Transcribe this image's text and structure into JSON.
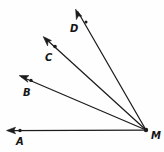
{
  "figure": {
    "type": "geometry-ray-diagram",
    "background_color": "#fefefe",
    "stroke_color": "#1c1c1c",
    "vertex": {
      "label": "M",
      "x": 146,
      "y": 130,
      "label_x": 151,
      "label_y": 139
    },
    "rays": [
      {
        "name": "ray-MA",
        "label": "A",
        "point_x": 20,
        "point_y": 130.5,
        "label_x": 16,
        "label_y": 145,
        "tip_x": 7,
        "tip_y": 130.5,
        "arrow_angle_deg": 180
      },
      {
        "name": "ray-MB",
        "label": "B",
        "point_x": 31,
        "point_y": 80,
        "label_x": 23,
        "label_y": 96,
        "tip_x": 20,
        "tip_y": 75,
        "arrow_angle_deg": 204
      },
      {
        "name": "ray-MC",
        "label": "C",
        "point_x": 55,
        "point_y": 46,
        "label_x": 45,
        "label_y": 61,
        "tip_x": 44,
        "tip_y": 37,
        "arrow_angle_deg": 219
      },
      {
        "name": "ray-MD",
        "label": "D",
        "point_x": 86,
        "point_y": 22,
        "label_x": 70,
        "label_y": 32,
        "tip_x": 76,
        "tip_y": 9,
        "arrow_angle_deg": 232
      }
    ]
  }
}
